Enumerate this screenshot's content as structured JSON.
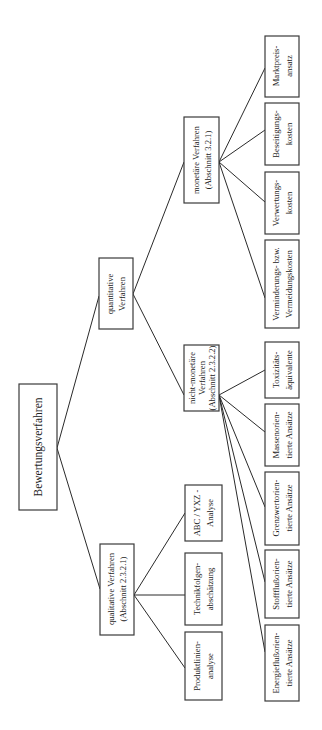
{
  "diagram": {
    "type": "tree",
    "orientation": "rotated 90° counter-clockwise (root on left, leaves on right, text reads bottom-to-top)",
    "root": {
      "label": "Bewertungsverfahren"
    },
    "branches": {
      "quantitative": {
        "lines": [
          "quantitative",
          "Verfahren"
        ]
      },
      "qualitative": {
        "lines": [
          "qualitative Verfahren",
          "(Abschnitt 2.3.2.1)"
        ],
        "children": [
          {
            "lines": [
              "ABC / YXZ -",
              "Analyse"
            ]
          },
          {
            "lines": [
              "Technikfolgen-",
              "abschätzung"
            ]
          },
          {
            "lines": [
              "Produktlinien-",
              "analyse"
            ]
          }
        ]
      },
      "monetary": {
        "lines": [
          "monetäre Verfahren",
          "(Abschnitt 3.2.1)"
        ],
        "children": [
          {
            "lines": [
              "Marktpreis-",
              "ansatz"
            ]
          },
          {
            "lines": [
              "Beseitigungs-",
              "kosten"
            ]
          },
          {
            "lines": [
              "Verwertungs-",
              "kosten"
            ]
          },
          {
            "lines": [
              "Verminderungs- bzw.",
              "Vermeidungskosten"
            ]
          }
        ]
      },
      "non_monetary": {
        "lines": [
          "nicht-monetäre",
          "Verfahren",
          "(Abschnitt 2.3.2.2)"
        ],
        "children": [
          {
            "lines": [
              "Toxizitäts-",
              "äquivalente"
            ]
          },
          {
            "lines": [
              "Massenorien-",
              "tierte Ansätze"
            ]
          },
          {
            "lines": [
              "Grenzwertorien-",
              "tierte Ansätze"
            ]
          },
          {
            "lines": [
              "Stoffflußorien-",
              "tierte Ansätze"
            ]
          },
          {
            "lines": [
              "Energieflußorien-",
              "tierte Ansätze"
            ]
          }
        ]
      }
    }
  }
}
